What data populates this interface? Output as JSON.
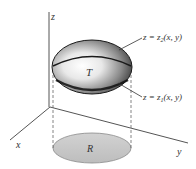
{
  "figure": {
    "axes": {
      "x_label": "x",
      "y_label": "y",
      "z_label": "z"
    },
    "solid": {
      "label": "T",
      "top_surface": {
        "lhs": "z = z",
        "sub": "2",
        "args": "(x, y)"
      },
      "bottom_surface": {
        "lhs": "z = z",
        "sub": "1",
        "args": "(x, y)"
      }
    },
    "region": {
      "label": "R"
    },
    "colors": {
      "axis": "#555555",
      "solid_dark": "#2a2a2a",
      "solid_mid": "#8a8a8a",
      "solid_highlight": "#ffffff",
      "region_fill": "#c8c8c8",
      "region_stroke": "#888888"
    }
  }
}
